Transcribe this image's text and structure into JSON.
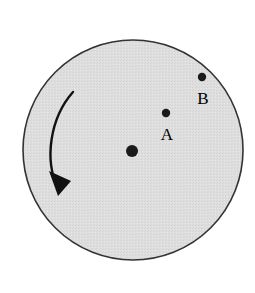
{
  "figure": {
    "background_color": "#ffffff",
    "disk": {
      "name": "rotating-disk",
      "fill_color": "#dedede",
      "stroke_color": "#333333",
      "center_x": 133,
      "center_y": 150,
      "radius": 110,
      "stroke_width": 1.6
    },
    "axis_point": {
      "name": "rotation-axis-center",
      "x": 132,
      "y": 151,
      "radius": 6,
      "color": "#1a1a1a"
    },
    "points": [
      {
        "id": "A",
        "label": "A",
        "dot_x": 166,
        "dot_y": 113,
        "dot_radius": 4.2,
        "label_x": 167,
        "label_y": 140,
        "color": "#1a1a1a"
      },
      {
        "id": "B",
        "label": "B",
        "dot_x": 202,
        "dot_y": 77,
        "dot_radius": 4.2,
        "label_x": 203,
        "label_y": 104,
        "color": "#1a1a1a"
      }
    ],
    "rotation_arrow": {
      "name": "counterclockwise-rotation-arrow",
      "direction": "counterclockwise",
      "color": "#111111",
      "stroke_width": 2.4,
      "path": "M 73 92 C 50 118, 44 160, 58 188",
      "arrowhead_points": "58,196 49,173 69,180"
    }
  }
}
